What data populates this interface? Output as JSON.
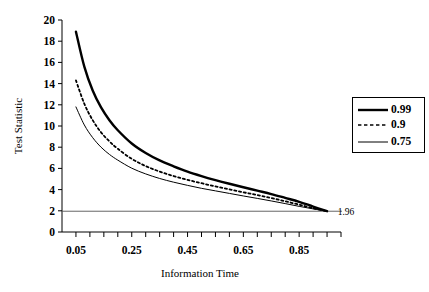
{
  "chart_data": {
    "type": "line",
    "title": "",
    "xlabel": "Information Time",
    "ylabel": "Test Statistic",
    "xlim": [
      0.0,
      1.0
    ],
    "ylim": [
      0,
      20
    ],
    "grid": false,
    "legend_position": "right",
    "y_ticks": [
      0,
      2,
      4,
      6,
      8,
      10,
      12,
      14,
      16,
      18,
      20
    ],
    "y_tick_labels": [
      "0",
      "2",
      "4",
      "6",
      "8",
      "10",
      "12",
      "14",
      "16",
      "18",
      "20"
    ],
    "x_tick_labels": [
      "0.05",
      "0.25",
      "0.45",
      "0.65",
      "0.85"
    ],
    "x_tick_label_values": [
      0.05,
      0.25,
      0.45,
      0.65,
      0.85
    ],
    "x_minor_ticks": [
      0.05,
      0.1,
      0.15,
      0.2,
      0.25,
      0.3,
      0.35,
      0.4,
      0.45,
      0.5,
      0.55,
      0.6,
      0.65,
      0.7,
      0.75,
      0.8,
      0.85,
      0.9,
      0.95,
      1.0
    ],
    "annotations": [
      {
        "text": "1.96",
        "x": 0.97,
        "y": 1.96
      }
    ],
    "reference_lines": [
      {
        "name": "critical-value-line",
        "y": 1.96,
        "style": "solid",
        "color": "#555555"
      }
    ],
    "series": [
      {
        "name": "0.99",
        "style": "solid",
        "width": 2.4,
        "color": "#000000",
        "x": [
          0.05,
          0.08,
          0.11,
          0.14,
          0.17,
          0.2,
          0.25,
          0.3,
          0.35,
          0.4,
          0.45,
          0.5,
          0.55,
          0.6,
          0.65,
          0.7,
          0.75,
          0.8,
          0.85,
          0.9,
          0.95
        ],
        "y": [
          18.9,
          15.6,
          13.35,
          11.75,
          10.55,
          9.6,
          8.35,
          7.45,
          6.75,
          6.2,
          5.7,
          5.28,
          4.9,
          4.55,
          4.22,
          3.9,
          3.58,
          3.22,
          2.85,
          2.4,
          1.96
        ]
      },
      {
        "name": "0.9",
        "style": "dotted",
        "width": 1.8,
        "color": "#000000",
        "x": [
          0.05,
          0.08,
          0.11,
          0.14,
          0.17,
          0.2,
          0.25,
          0.3,
          0.35,
          0.4,
          0.45,
          0.5,
          0.55,
          0.6,
          0.65,
          0.7,
          0.75,
          0.8,
          0.85,
          0.9,
          0.95
        ],
        "y": [
          14.3,
          12.1,
          10.55,
          9.4,
          8.55,
          7.85,
          6.9,
          6.22,
          5.7,
          5.28,
          4.92,
          4.6,
          4.3,
          4.02,
          3.75,
          3.48,
          3.2,
          2.9,
          2.58,
          2.25,
          1.96
        ]
      },
      {
        "name": "0.75",
        "style": "solid",
        "width": 1.0,
        "color": "#000000",
        "x": [
          0.05,
          0.08,
          0.11,
          0.14,
          0.17,
          0.2,
          0.25,
          0.3,
          0.35,
          0.4,
          0.45,
          0.5,
          0.55,
          0.6,
          0.65,
          0.7,
          0.75,
          0.8,
          0.85,
          0.9,
          0.95
        ],
        "y": [
          11.8,
          10.1,
          8.9,
          8.0,
          7.32,
          6.78,
          6.02,
          5.48,
          5.05,
          4.7,
          4.4,
          4.12,
          3.88,
          3.64,
          3.4,
          3.17,
          2.93,
          2.68,
          2.42,
          2.18,
          1.96
        ]
      }
    ]
  },
  "legend": {
    "entries": [
      {
        "label": "0.99",
        "style": "solid-thick"
      },
      {
        "label": "0.9",
        "style": "dashed"
      },
      {
        "label": "0.75",
        "style": "solid-thin"
      }
    ]
  }
}
